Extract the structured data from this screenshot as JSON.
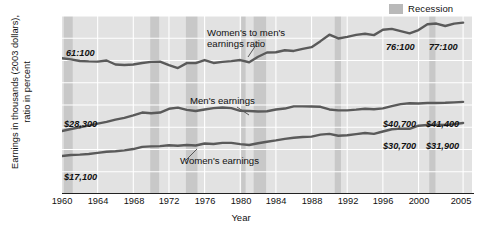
{
  "legend": {
    "label": "Recession",
    "swatch_color": "#b9b9b9"
  },
  "axes": {
    "ylabel_line1": "Earnings in thousands (2003 dollars),",
    "ylabel_line2": "ratio in percent",
    "xlabel": "Year",
    "yticks": [
      "0",
      "10",
      "20",
      "30",
      "40",
      "50",
      "60",
      "70",
      "80"
    ],
    "xticks": [
      "1960",
      "1964",
      "1968",
      "1972",
      "1976",
      "1980",
      "1984",
      "1988",
      "1992",
      "1996",
      "2000",
      "2005"
    ]
  },
  "annotations": {
    "ratio_series_label_l1": "Women's to men's",
    "ratio_series_label_l2": "earnings ratio",
    "men_series_label": "Men's earnings",
    "women_series_label": "Women's earnings",
    "ratio_start": "61:100",
    "ratio_2000": "76:100",
    "ratio_2005": "77:100",
    "men_start": "$28,300",
    "men_2000": "$40,700",
    "men_2005": "$41,400",
    "women_start": "$17,100",
    "women_2000": "$30,700",
    "women_2005": "$31,900"
  },
  "colors": {
    "plot_background": "#e2e2e2",
    "gridline": "#ffffff",
    "recession_band": "#c8c8c8",
    "line": "#5a5a5a",
    "axis": "#222222"
  },
  "chart_data": {
    "type": "line",
    "title": "",
    "xlabel": "Year",
    "ylabel": "Earnings in thousands (2003 dollars), ratio in percent",
    "xlim": [
      1960,
      2006
    ],
    "ylim": [
      0,
      80
    ],
    "grid": true,
    "legend_position": "top-right",
    "legend_entries": [
      "Recession"
    ],
    "x": [
      1960,
      1961,
      1962,
      1963,
      1964,
      1965,
      1966,
      1967,
      1968,
      1969,
      1970,
      1971,
      1972,
      1973,
      1974,
      1975,
      1976,
      1977,
      1978,
      1979,
      1980,
      1981,
      1982,
      1983,
      1984,
      1985,
      1986,
      1987,
      1988,
      1989,
      1990,
      1991,
      1992,
      1993,
      1994,
      1995,
      1996,
      1997,
      1998,
      1999,
      2000,
      2001,
      2002,
      2003,
      2004,
      2005
    ],
    "series": [
      {
        "name": "Women's to men's earnings ratio",
        "unit": "percent",
        "values": [
          61.0,
          60.5,
          59.8,
          59.6,
          59.5,
          60.0,
          58.2,
          58.0,
          58.2,
          58.9,
          59.4,
          59.5,
          57.9,
          56.6,
          58.8,
          58.8,
          60.2,
          58.9,
          59.4,
          59.7,
          60.2,
          59.2,
          61.7,
          63.6,
          63.7,
          64.6,
          64.3,
          65.2,
          66.0,
          68.7,
          71.6,
          69.9,
          70.6,
          71.5,
          72.0,
          71.4,
          73.8,
          74.2,
          73.2,
          72.2,
          73.7,
          76.3,
          76.6,
          75.5,
          76.6,
          77.0
        ],
        "label_start": "61:100",
        "label_2000": "76:100",
        "label_2005": "77:100"
      },
      {
        "name": "Men's earnings",
        "unit": "thousands of 2003 dollars",
        "values": [
          28.3,
          29.2,
          30.0,
          30.7,
          31.6,
          32.4,
          33.4,
          34.2,
          35.3,
          36.6,
          36.3,
          36.6,
          38.3,
          38.8,
          37.8,
          37.3,
          38.0,
          38.6,
          38.9,
          38.6,
          37.4,
          37.3,
          37.1,
          37.2,
          38.0,
          38.4,
          39.4,
          39.4,
          39.3,
          39.2,
          38.0,
          37.6,
          37.6,
          37.9,
          38.3,
          38.1,
          38.5,
          39.5,
          40.4,
          40.8,
          40.7,
          40.9,
          40.9,
          41.0,
          41.2,
          41.4
        ],
        "label_start": "$28,300",
        "label_2000": "$40,700",
        "label_2005": "$41,400"
      },
      {
        "name": "Women's earnings",
        "unit": "thousands of 2003 dollars",
        "values": [
          17.1,
          17.5,
          17.7,
          18.0,
          18.5,
          19.0,
          19.2,
          19.6,
          20.2,
          21.2,
          21.4,
          21.5,
          21.9,
          21.7,
          22.0,
          21.8,
          22.7,
          22.5,
          23.0,
          23.0,
          22.4,
          22.0,
          22.8,
          23.5,
          24.1,
          24.8,
          25.3,
          25.6,
          25.8,
          26.7,
          27.0,
          26.2,
          26.4,
          26.9,
          27.4,
          27.0,
          28.1,
          29.1,
          29.4,
          29.3,
          30.7,
          31.0,
          31.2,
          31.0,
          31.4,
          31.9
        ],
        "label_start": "$17,100",
        "label_2000": "$30,700",
        "label_2005": "$31,900"
      }
    ],
    "recession_bands": [
      {
        "start": 1960.2,
        "end": 1961.2
      },
      {
        "start": 1969.9,
        "end": 1970.9
      },
      {
        "start": 1973.9,
        "end": 1975.2
      },
      {
        "start": 1980.1,
        "end": 1980.6
      },
      {
        "start": 1981.5,
        "end": 1982.9
      },
      {
        "start": 1990.6,
        "end": 1991.3
      },
      {
        "start": 2001.2,
        "end": 2001.9
      }
    ]
  }
}
